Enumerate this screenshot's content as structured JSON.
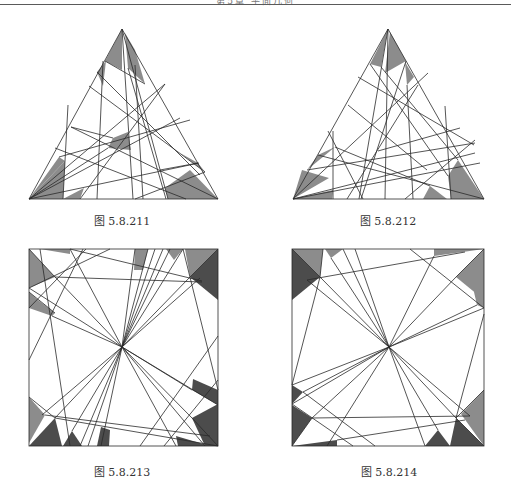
{
  "header": {
    "text": "第5章 平面几何"
  },
  "colors": {
    "line": "#2a2a2a",
    "shade_light": "#8c8c8c",
    "shade_dark": "#4c4c4c",
    "background": "#ffffff"
  },
  "figures": [
    {
      "id": "5.8.211",
      "caption": "图 5.8.211",
      "shape": "triangle"
    },
    {
      "id": "5.8.212",
      "caption": "图 5.8.212",
      "shape": "triangle"
    },
    {
      "id": "5.8.213",
      "caption": "图 5.8.213",
      "shape": "square"
    },
    {
      "id": "5.8.214",
      "caption": "图 5.8.214",
      "shape": "square"
    }
  ]
}
